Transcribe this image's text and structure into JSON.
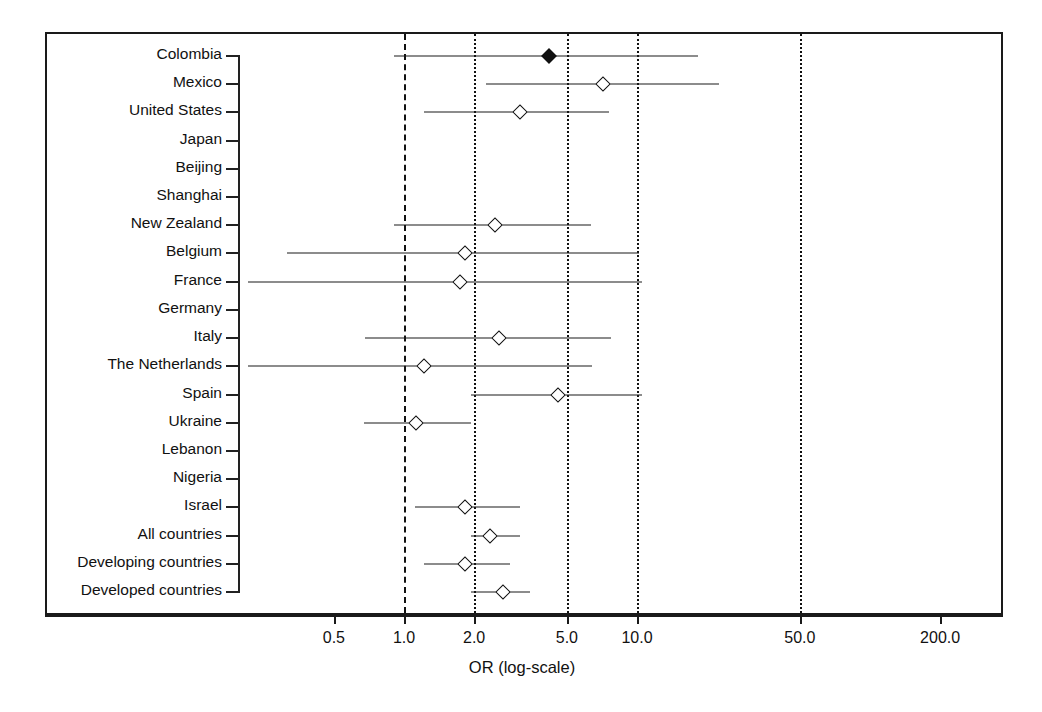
{
  "figure": {
    "axis_title": "OR (log-scale)",
    "x_tick_labels": [
      "0.5",
      "1.0",
      "2.0",
      "5.0",
      "10.0",
      "50.0",
      "200.0"
    ]
  },
  "chart_data": {
    "type": "scatter",
    "subtype": "forest-plot",
    "title": "",
    "xlabel": "OR (log-scale)",
    "ylabel": "",
    "xscale": "log",
    "xlim": [
      0.38,
      330.0
    ],
    "x_ticks": [
      0.5,
      1.0,
      2.0,
      5.0,
      10.0,
      50.0,
      200.0
    ],
    "x_tick_labels": [
      "0.5",
      "1.0",
      "2.0",
      "5.0",
      "10.0",
      "50.0",
      "200.0"
    ],
    "grid": false,
    "reference_lines": [
      {
        "value": 1.0,
        "style": "dashed"
      },
      {
        "value": 2.0,
        "style": "dotted"
      },
      {
        "value": 5.0,
        "style": "dotted"
      },
      {
        "value": 10.0,
        "style": "dotted"
      },
      {
        "value": 50.0,
        "style": "dotted"
      }
    ],
    "categories": [
      "Colombia",
      "Mexico",
      "United States",
      "Japan",
      "Beijing",
      "Shanghai",
      "New Zealand",
      "Belgium",
      "France",
      "Germany",
      "Italy",
      "The Netherlands",
      "Spain",
      "Ukraine",
      "Lebanon",
      "Nigeria",
      "Israel",
      "All countries",
      "Developing countries",
      "Developed countries"
    ],
    "points": [
      {
        "label": "Colombia",
        "or": 4.1,
        "ci_low": 0.89,
        "ci_high": 18.0,
        "marker": "filled-diamond",
        "has_data": true
      },
      {
        "label": "Mexico",
        "or": 7.0,
        "ci_low": 2.2,
        "ci_high": 22.0,
        "marker": "open-diamond",
        "has_data": true
      },
      {
        "label": "United States",
        "or": 3.1,
        "ci_low": 1.2,
        "ci_high": 7.4,
        "marker": "open-diamond",
        "has_data": true
      },
      {
        "label": "Japan",
        "or": null,
        "ci_low": null,
        "ci_high": null,
        "marker": "none",
        "has_data": false
      },
      {
        "label": "Beijing",
        "or": null,
        "ci_low": null,
        "ci_high": null,
        "marker": "none",
        "has_data": false
      },
      {
        "label": "Shanghai",
        "or": null,
        "ci_low": null,
        "ci_high": null,
        "marker": "none",
        "has_data": false
      },
      {
        "label": "New Zealand",
        "or": 2.4,
        "ci_low": 0.89,
        "ci_high": 6.2,
        "marker": "open-diamond",
        "has_data": true
      },
      {
        "label": "Belgium",
        "or": 1.8,
        "ci_low": 0.31,
        "ci_high": 10.0,
        "marker": "open-diamond",
        "has_data": true
      },
      {
        "label": "France",
        "or": 1.7,
        "ci_low": 0.21,
        "ci_high": 10.3,
        "marker": "open-diamond",
        "has_data": true
      },
      {
        "label": "Germany",
        "or": null,
        "ci_low": null,
        "ci_high": null,
        "marker": "none",
        "has_data": false
      },
      {
        "label": "Italy",
        "or": 2.5,
        "ci_low": 0.67,
        "ci_high": 7.6,
        "marker": "open-diamond",
        "has_data": true
      },
      {
        "label": "The Netherlands",
        "or": 1.2,
        "ci_low": 0.21,
        "ci_high": 6.3,
        "marker": "open-diamond",
        "has_data": true
      },
      {
        "label": "Spain",
        "or": 4.5,
        "ci_low": 1.9,
        "ci_high": 10.3,
        "marker": "open-diamond",
        "has_data": true
      },
      {
        "label": "Ukraine",
        "or": 1.1,
        "ci_low": 0.66,
        "ci_high": 1.9,
        "marker": "open-diamond",
        "has_data": true
      },
      {
        "label": "Lebanon",
        "or": null,
        "ci_low": null,
        "ci_high": null,
        "marker": "none",
        "has_data": false
      },
      {
        "label": "Nigeria",
        "or": null,
        "ci_low": null,
        "ci_high": null,
        "marker": "none",
        "has_data": false
      },
      {
        "label": "Israel",
        "or": 1.8,
        "ci_low": 1.09,
        "ci_high": 3.1,
        "marker": "open-diamond",
        "has_data": true
      },
      {
        "label": "All countries",
        "or": 2.3,
        "ci_low": 1.9,
        "ci_high": 3.1,
        "marker": "open-diamond",
        "has_data": true
      },
      {
        "label": "Developing countries",
        "or": 1.8,
        "ci_low": 1.2,
        "ci_high": 2.8,
        "marker": "open-diamond",
        "has_data": true
      },
      {
        "label": "Developed countries",
        "or": 2.6,
        "ci_low": 1.9,
        "ci_high": 3.4,
        "marker": "open-diamond",
        "has_data": true
      }
    ]
  }
}
